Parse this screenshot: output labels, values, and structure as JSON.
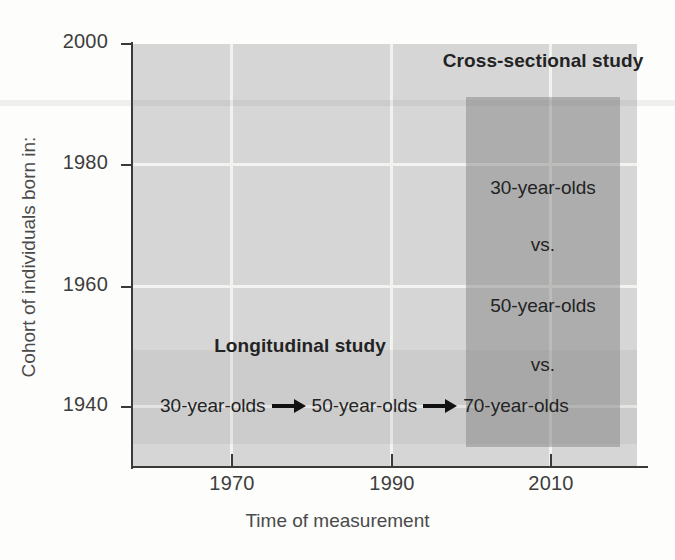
{
  "figure": {
    "type": "diagram",
    "caption_absent": true
  },
  "axes": {
    "x": {
      "title": "Time of measurement",
      "ticks": [
        {
          "label": "1970",
          "value": 1970,
          "px": 232
        },
        {
          "label": "1990",
          "value": 1990,
          "px": 392
        },
        {
          "label": "2010",
          "value": 2010,
          "px": 551
        }
      ],
      "range": [
        1962,
        2025
      ]
    },
    "y": {
      "title": "Cohort of individuals born in:",
      "ticks": [
        {
          "label": "2000",
          "value": 2000,
          "px": 44
        },
        {
          "label": "1980",
          "value": 1980,
          "px": 165
        },
        {
          "label": "1960",
          "value": 1960,
          "px": 287
        },
        {
          "label": "1940",
          "value": 1940,
          "px": 407
        }
      ],
      "range": [
        1930,
        2000
      ]
    }
  },
  "regions": {
    "cross_sectional": {
      "heading": "Cross-sectional study",
      "labels": [
        {
          "text": "30-year-olds",
          "y_value": 1980
        },
        {
          "text": "vs.",
          "y_value": 1970
        },
        {
          "text": "50-year-olds",
          "y_value": 1960
        },
        {
          "text": "vs.",
          "y_value": 1950
        },
        {
          "text": "70-year-olds",
          "y_value": 1940
        }
      ],
      "x_span": [
        2000,
        2020
      ],
      "y_span": [
        1935,
        1991
      ],
      "fill_color": "#8f8f8f"
    },
    "longitudinal": {
      "heading": "Longitudinal study",
      "steps": [
        {
          "text": "30-year-olds",
          "x_value": 1970
        },
        {
          "text": "50-year-olds",
          "x_value": 1990
        },
        {
          "text": "70-year-olds",
          "x_value": 2010
        }
      ],
      "arrow_icon": "right-arrow-icon",
      "y_span": [
        1935,
        1950
      ],
      "fill_color": "#c2c2c2"
    }
  },
  "style": {
    "plot_background": "#d6d6d6",
    "gridline_color": "#f2f2f0",
    "axis_color": "#3a3a3a",
    "text_color": "#232323",
    "page_background": "#fdfdfc"
  }
}
